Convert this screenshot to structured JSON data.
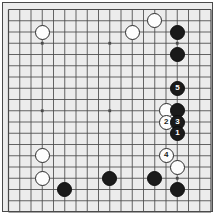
{
  "diagram": {
    "type": "go-board-diagram",
    "board_size": 19,
    "grid_lines": 19,
    "background_color": "#ececec",
    "line_color": "#4a4a4a",
    "frame_color": "#4a4a4a",
    "black_color": "#1a1a1a",
    "white_color": "#fdfdfd",
    "geometry": {
      "origin_x": 8.5,
      "origin_y": 9.5,
      "step": 11.25,
      "stone_diameter": 15
    },
    "star_points": [
      {
        "col": 3,
        "row": 3
      },
      {
        "col": 9,
        "row": 3
      },
      {
        "col": 15,
        "row": 3
      },
      {
        "col": 3,
        "row": 9
      },
      {
        "col": 9,
        "row": 9
      },
      {
        "col": 15,
        "row": 9
      },
      {
        "col": 3,
        "row": 15
      },
      {
        "col": 9,
        "row": 15
      },
      {
        "col": 15,
        "row": 15
      }
    ],
    "stones": [
      {
        "id": "w-a",
        "color": "white",
        "label": "",
        "col": 3,
        "row": 2
      },
      {
        "id": "w-b",
        "color": "white",
        "label": "",
        "col": 11,
        "row": 2
      },
      {
        "id": "w-c",
        "color": "white",
        "label": "",
        "col": 13,
        "row": 1
      },
      {
        "id": "b-a",
        "color": "black",
        "label": "",
        "col": 15,
        "row": 2
      },
      {
        "id": "b-b",
        "color": "black",
        "label": "",
        "col": 15,
        "row": 4
      },
      {
        "id": "m5",
        "color": "black",
        "label": "5",
        "col": 15,
        "row": 7
      },
      {
        "id": "w-d",
        "color": "white",
        "label": "",
        "col": 14,
        "row": 9
      },
      {
        "id": "b-c",
        "color": "black",
        "label": "",
        "col": 15,
        "row": 9
      },
      {
        "id": "m2",
        "color": "white",
        "label": "2",
        "col": 14,
        "row": 10
      },
      {
        "id": "m3",
        "color": "black",
        "label": "3",
        "col": 15,
        "row": 10
      },
      {
        "id": "m1",
        "color": "black",
        "label": "1",
        "col": 15,
        "row": 11
      },
      {
        "id": "w-e",
        "color": "white",
        "label": "",
        "col": 3,
        "row": 13
      },
      {
        "id": "m4",
        "color": "white",
        "label": "4",
        "col": 14,
        "row": 13
      },
      {
        "id": "w-f",
        "color": "white",
        "label": "",
        "col": 15,
        "row": 14
      },
      {
        "id": "w-g",
        "color": "white",
        "label": "",
        "col": 3,
        "row": 15
      },
      {
        "id": "b-d",
        "color": "black",
        "label": "",
        "col": 5,
        "row": 16
      },
      {
        "id": "b-e",
        "color": "black",
        "label": "",
        "col": 9,
        "row": 15
      },
      {
        "id": "b-f",
        "color": "black",
        "label": "",
        "col": 13,
        "row": 15
      },
      {
        "id": "b-g",
        "color": "black",
        "label": "",
        "col": 15,
        "row": 16
      }
    ],
    "move_sequence": [
      {
        "number": "1",
        "color": "black"
      },
      {
        "number": "2",
        "color": "white"
      },
      {
        "number": "3",
        "color": "black"
      },
      {
        "number": "4",
        "color": "white"
      },
      {
        "number": "5",
        "color": "black"
      }
    ]
  }
}
